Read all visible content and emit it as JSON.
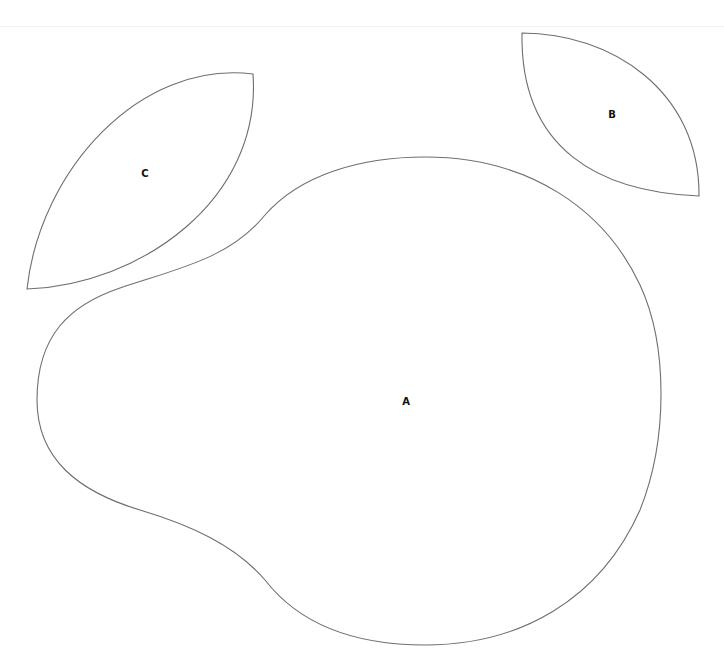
{
  "diagram": {
    "title": "",
    "colors": {
      "background": "#ffffff",
      "outline": "#6e6e6e",
      "label": "#111111"
    },
    "shapes": [
      {
        "id": "A",
        "label": "A",
        "kind": "rounded-blob"
      },
      {
        "id": "B",
        "label": "B",
        "kind": "lens"
      },
      {
        "id": "C",
        "label": "C",
        "kind": "lens"
      }
    ]
  }
}
